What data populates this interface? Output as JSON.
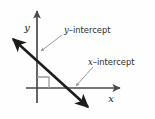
{
  "figure": {
    "type": "coordinate-axes-diagram",
    "background_color": "#fefefe",
    "width": 155,
    "height": 119,
    "axis_color": "#4a4a4a",
    "line_color": "#1c1c1c",
    "leader_color": "#9a9a9a",
    "text_color": "#2b2b2b",
    "axes": {
      "x_axis_label": "x",
      "y_axis_label": "y",
      "origin": {
        "x": 37,
        "y": 88
      }
    },
    "annotations": [
      {
        "id": "y-intercept",
        "italic_part": "y",
        "dash": "–",
        "word": "intercept",
        "full_text": "y–intercept",
        "label_x": 64,
        "label_y": 32,
        "point_x": 37,
        "point_y": 52
      },
      {
        "id": "x-intercept",
        "italic_part": "x",
        "dash": "–",
        "word": "intercept",
        "full_text": "x–intercept",
        "label_x": 88,
        "label_y": 64,
        "point_x": 73,
        "point_y": 88
      }
    ],
    "right_angle_marker": {
      "present": true,
      "size": 12
    },
    "diagonal_line": {
      "start_x": 10,
      "start_y": 36,
      "end_x": 91,
      "end_y": 110,
      "double_arrow": true
    }
  }
}
